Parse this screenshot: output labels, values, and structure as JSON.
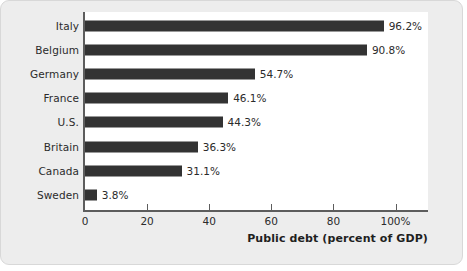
{
  "chart_data": {
    "type": "bar",
    "orientation": "horizontal",
    "title": "",
    "xlabel": "Public debt (percent of GDP)",
    "ylabel": "",
    "xlim": [
      0,
      105
    ],
    "grid": false,
    "legend": null,
    "categories": [
      "Italy",
      "Belgium",
      "Germany",
      "France",
      "U.S.",
      "Britain",
      "Canada",
      "Sweden"
    ],
    "values": [
      96.2,
      90.8,
      54.7,
      46.1,
      44.3,
      36.3,
      31.1,
      3.8
    ],
    "value_labels": [
      "96.2%",
      "90.8%",
      "54.7%",
      "46.1%",
      "44.3%",
      "36.3%",
      "31.1%",
      "3.8%"
    ],
    "xticks": [
      0,
      20,
      40,
      60,
      80,
      100
    ],
    "xtick_labels": [
      "0",
      "20",
      "40",
      "60",
      "80",
      "100%"
    ],
    "bar_color": "#333333",
    "panel_color": "#ffffff",
    "card_color": "#ededed"
  },
  "axis": {
    "title": "Public debt (percent of GDP)"
  }
}
